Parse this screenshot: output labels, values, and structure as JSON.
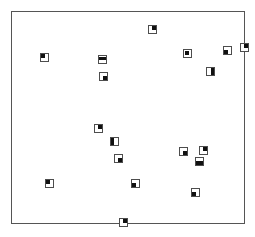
{
  "figure": {
    "width": 255,
    "height": 237,
    "background_color": "#ffffff"
  },
  "plot_frame": {
    "name": "plot-border",
    "x": 11,
    "y": 11,
    "width": 234,
    "height": 213,
    "border_width": 1,
    "border_color": "#555555",
    "fill_color": "#ffffff"
  },
  "marker_style": {
    "size": 9,
    "outline_width": 1,
    "outline_color": "#4d4d4d",
    "fill_color": "#111111",
    "fill_fraction": 0.42
  },
  "chart_data": {
    "type": "scatter",
    "title": "",
    "subtitle": "",
    "xlabel": "",
    "ylabel": "",
    "grid": false,
    "legend": "none",
    "axes_visible": false,
    "ticks_visible": false,
    "xlim": [
      0,
      234
    ],
    "ylim": [
      0,
      213
    ],
    "point_count": 20,
    "series": [
      {
        "name": "points",
        "marker": "square-with-inner-block",
        "color": "#111111",
        "points": [
          {
            "id": "p1",
            "x": 141,
            "y": 18,
            "fill_corner": "top-right"
          },
          {
            "id": "p2",
            "x": 33,
            "y": 46,
            "fill_corner": "top-left"
          },
          {
            "id": "p3",
            "x": 91,
            "y": 48,
            "fill_corner": "center-bar"
          },
          {
            "id": "p4",
            "x": 176,
            "y": 42,
            "fill_corner": "center"
          },
          {
            "id": "p5",
            "x": 216,
            "y": 39,
            "fill_corner": "bottom-left"
          },
          {
            "id": "p6",
            "x": 233,
            "y": 36,
            "fill_corner": "top-right"
          },
          {
            "id": "p7",
            "x": 92,
            "y": 65,
            "fill_corner": "bottom-right"
          },
          {
            "id": "p8",
            "x": 199,
            "y": 60,
            "fill_corner": "right-bar"
          },
          {
            "id": "p9",
            "x": 87,
            "y": 117,
            "fill_corner": "top-right"
          },
          {
            "id": "p10",
            "x": 103,
            "y": 130,
            "fill_corner": "left-bar"
          },
          {
            "id": "p11",
            "x": 192,
            "y": 139,
            "fill_corner": "top-right"
          },
          {
            "id": "p12",
            "x": 172,
            "y": 140,
            "fill_corner": "bottom-right"
          },
          {
            "id": "p13",
            "x": 107,
            "y": 147,
            "fill_corner": "bottom-right"
          },
          {
            "id": "p14",
            "x": 188,
            "y": 150,
            "fill_corner": "bottom-split"
          },
          {
            "id": "p15",
            "x": 38,
            "y": 172,
            "fill_corner": "top-left"
          },
          {
            "id": "p16",
            "x": 124,
            "y": 172,
            "fill_corner": "bottom-left"
          },
          {
            "id": "p17",
            "x": 184,
            "y": 181,
            "fill_corner": "bottom-left"
          },
          {
            "id": "p18",
            "x": 112,
            "y": 211,
            "fill_corner": "top-right"
          },
          {
            "id": "p19",
            "x": 44,
            "y": 48,
            "fill_corner": "none"
          },
          {
            "id": "p20",
            "x": 60,
            "y": 60,
            "fill_corner": "none"
          }
        ]
      }
    ]
  }
}
